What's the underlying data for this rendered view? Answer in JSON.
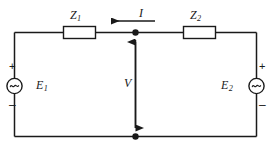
{
  "diagram": {
    "type": "electrical-circuit-schematic",
    "background_color": "#ffffff",
    "line_color": "#1a1a1a"
  },
  "labels": {
    "impedance_1": {
      "symbol": "Z",
      "subscript": "1"
    },
    "impedance_2": {
      "symbol": "Z",
      "subscript": "2"
    },
    "current": {
      "symbol": "I",
      "subscript": ""
    },
    "voltage": {
      "symbol": "V",
      "subscript": ""
    },
    "source_1": {
      "symbol": "E",
      "subscript": "1"
    },
    "source_2": {
      "symbol": "E",
      "subscript": "2"
    }
  },
  "polarity": {
    "source_1_plus": "+",
    "source_1_minus": "–",
    "source_2_plus": "+",
    "source_2_minus": "–"
  },
  "components": {
    "source_1_kind": "ac-source-tilde",
    "source_2_kind": "ac-source-tilde",
    "impedance_1_kind": "rectangular-box",
    "impedance_2_kind": "rectangular-box",
    "current_arrow_direction": "left",
    "voltage_arrow_direction": "both-up-and-down",
    "node_count": 2
  }
}
